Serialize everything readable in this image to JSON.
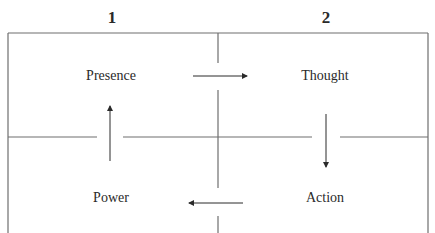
{
  "columns": [
    {
      "label": "1"
    },
    {
      "label": "2"
    }
  ],
  "quadrants": {
    "top_left": "Presence",
    "top_right": "Thought",
    "bottom_right": "Action",
    "bottom_left": "Power"
  },
  "flow": [
    {
      "from": "Presence",
      "to": "Thought",
      "direction": "right"
    },
    {
      "from": "Thought",
      "to": "Action",
      "direction": "down"
    },
    {
      "from": "Action",
      "to": "Power",
      "direction": "left"
    },
    {
      "from": "Power",
      "to": "Presence",
      "direction": "up"
    }
  ],
  "colors": {
    "line": "#6e6e6e",
    "text": "#2a2a2a",
    "background": "#ffffff"
  }
}
